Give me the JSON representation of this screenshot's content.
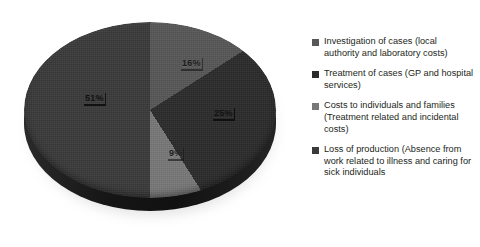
{
  "chart_data": {
    "type": "pie",
    "title": "",
    "subtitle": "",
    "xlabel": "",
    "ylabel": "",
    "legend_position": "right",
    "three_d": true,
    "start_angle_deg": 0,
    "direction": "clockwise",
    "categories": [
      "Investigation of cases (local authority and laboratory costs)",
      "Treatment of cases (GP and hospital services)",
      "Costs to individuals and families (Treatment related and incidental costs)",
      "Loss of production (Absence from work related to illness and caring for sick individuals"
    ],
    "values": [
      16,
      25,
      9,
      50
    ],
    "value_labels": [
      "16%",
      "25%",
      "9%",
      "51%"
    ],
    "colors": [
      "#575757",
      "#2b2b2b",
      "#787878",
      "#3a3a3a"
    ],
    "units": "percent"
  },
  "legend": {
    "items": [
      {
        "label": "Investigation of cases (local authority and laboratory costs)",
        "color": "#575757"
      },
      {
        "label": "Treatment of cases (GP and hospital services)",
        "color": "#2b2b2b"
      },
      {
        "label": "Costs to individuals and families (Treatment related and incidental costs)",
        "color": "#787878"
      },
      {
        "label": "Loss of production (Absence from work related to illness and caring for sick individuals",
        "color": "#3a3a3a"
      }
    ]
  },
  "labels": {
    "slice_1": "16%",
    "slice_2": "25%",
    "slice_3": "9%",
    "slice_4": "51%"
  }
}
